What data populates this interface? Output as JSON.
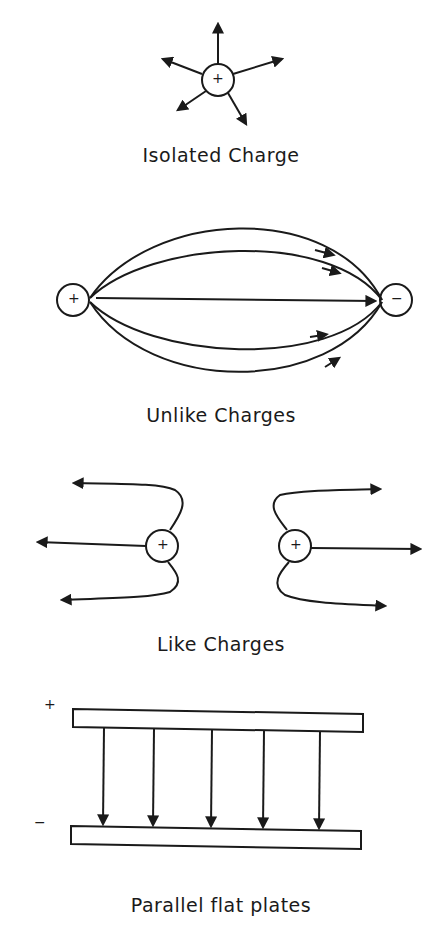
{
  "panels": [
    {
      "id": "isolated",
      "label": "Isolated Charge",
      "charge": "+"
    },
    {
      "id": "unlike",
      "label": "Unlike Charges",
      "charges": [
        "+",
        "−"
      ]
    },
    {
      "id": "like",
      "label": "Like Charges",
      "charges": [
        "+",
        "+"
      ]
    },
    {
      "id": "plates",
      "label": "Parallel flat plates",
      "plate_signs": [
        "+",
        "−"
      ]
    }
  ],
  "colors": {
    "ink": "#1a1a1a",
    "background": "#ffffff"
  }
}
